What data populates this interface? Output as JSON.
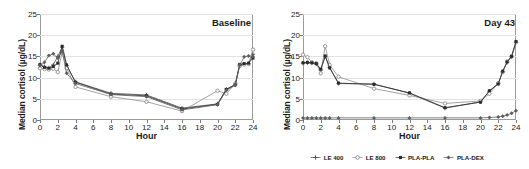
{
  "axes": {
    "ylabel": "Median cortisol (µg/dL)",
    "xlabel": "Hour",
    "yticks": [
      "0",
      "5",
      "10",
      "15",
      "20",
      "25"
    ],
    "xticks": [
      "0",
      "2",
      "4",
      "6",
      "8",
      "10",
      "12",
      "14",
      "16",
      "18",
      "20",
      "22",
      "24"
    ]
  },
  "legend": {
    "items": [
      {
        "label": "LE 400",
        "symbol": "plus-marker",
        "color": "#4d4d4d"
      },
      {
        "label": "LE 800",
        "symbol": "circle-marker",
        "color": "#8c8c8c"
      },
      {
        "label": "PLA-PLA",
        "symbol": "square-marker",
        "color": "#2b2b2b"
      },
      {
        "label": "PLA-DEX",
        "symbol": "diamond-marker",
        "color": "#5e5e5e"
      }
    ]
  },
  "chart_data": [
    {
      "type": "line",
      "title": "Baseline",
      "xlabel": "Hour",
      "ylabel": "Median cortisol (µg/dL)",
      "xlim": [
        0,
        24
      ],
      "ylim": [
        0,
        25
      ],
      "ytick_step": 5,
      "xtick_step": 2,
      "grid": true,
      "legend_position": "below-right-panel-shared",
      "series": [
        {
          "name": "LE 400",
          "color": "#4d4d4d",
          "x": [
            0,
            0.5,
            1,
            1.5,
            2,
            2.5,
            3,
            4,
            8,
            12,
            16,
            20,
            21,
            22,
            22.5,
            23,
            23.5,
            24
          ],
          "values": [
            13.0,
            12.6,
            12.3,
            13.0,
            15.0,
            17.2,
            12.8,
            9.0,
            6.3,
            5.9,
            2.8,
            3.8,
            7.3,
            8.4,
            13.0,
            13.2,
            13.3,
            15.5
          ]
        },
        {
          "name": "LE 800",
          "color": "#8c8c8c",
          "x": [
            0,
            0.5,
            1,
            1.5,
            2,
            2.5,
            3,
            4,
            8,
            12,
            16,
            20,
            21,
            22,
            22.5,
            23,
            23.5,
            24
          ],
          "values": [
            12.2,
            12.0,
            11.9,
            12.1,
            11.3,
            16.0,
            12.2,
            7.8,
            5.5,
            4.3,
            2.1,
            6.9,
            6.2,
            8.6,
            12.7,
            13.1,
            13.2,
            16.6
          ]
        },
        {
          "name": "PLA-PLA",
          "color": "#2b2b2b",
          "x": [
            0,
            0.5,
            1,
            1.5,
            2,
            2.5,
            3,
            4,
            8,
            12,
            16,
            20,
            21,
            22,
            22.5,
            23,
            23.5,
            24
          ],
          "values": [
            13.1,
            12.4,
            12.2,
            12.6,
            13.4,
            17.4,
            13.0,
            8.9,
            6.1,
            5.7,
            2.6,
            3.7,
            7.2,
            8.3,
            13.1,
            13.3,
            13.4,
            14.6
          ]
        },
        {
          "name": "PLA-DEX",
          "color": "#5e5e5e",
          "x": [
            0,
            0.5,
            1,
            1.5,
            2,
            2.5,
            3,
            4,
            8,
            12,
            16,
            20,
            21,
            22,
            22.5,
            23,
            23.5,
            24
          ],
          "values": [
            12.8,
            13.6,
            15.2,
            15.6,
            14.6,
            16.2,
            11.0,
            8.6,
            6.0,
            5.5,
            2.4,
            3.6,
            7.0,
            8.2,
            12.9,
            14.9,
            15.1,
            15.0
          ]
        }
      ]
    },
    {
      "type": "line",
      "title": "Day 43",
      "xlabel": "Hour",
      "ylabel": "Median cortisol (µg/dL)",
      "xlim": [
        0,
        24
      ],
      "ylim": [
        0,
        25
      ],
      "ytick_step": 5,
      "xtick_step": 2,
      "grid": true,
      "legend_position": "below",
      "series": [
        {
          "name": "LE 400",
          "color": "#4d4d4d",
          "x": [
            0,
            0.5,
            1,
            1.5,
            2,
            2.5,
            3,
            4,
            8,
            12,
            16,
            20,
            21,
            22,
            22.5,
            23,
            23.5,
            24
          ],
          "values": [
            13.4,
            13.5,
            13.4,
            13.2,
            11.8,
            15.0,
            12.4,
            8.6,
            8.5,
            6.3,
            2.8,
            4.3,
            6.8,
            8.6,
            11.4,
            13.6,
            14.9,
            18.4
          ]
        },
        {
          "name": "LE 800",
          "color": "#8c8c8c",
          "x": [
            0,
            0.5,
            1,
            1.5,
            2,
            2.5,
            3,
            4,
            8,
            12,
            16,
            20,
            21,
            22,
            22.5,
            23,
            23.5,
            24
          ],
          "values": [
            15.4,
            14.8,
            13.6,
            13.4,
            11.0,
            17.4,
            13.0,
            10.2,
            7.4,
            5.8,
            3.9,
            4.5,
            6.2,
            8.7,
            11.3,
            13.8,
            15.0,
            18.3
          ]
        },
        {
          "name": "PLA-PLA",
          "color": "#2b2b2b",
          "x": [
            0,
            0.5,
            1,
            1.5,
            2,
            2.5,
            3,
            4,
            8,
            12,
            16,
            20,
            21,
            22,
            22.5,
            23,
            23.5,
            24
          ],
          "values": [
            13.5,
            13.6,
            13.5,
            13.3,
            12.0,
            15.1,
            12.3,
            8.7,
            8.4,
            6.4,
            2.9,
            4.2,
            6.9,
            8.5,
            11.5,
            13.7,
            15.0,
            18.5
          ]
        },
        {
          "name": "PLA-DEX",
          "color": "#5e5e5e",
          "x": [
            0,
            0.5,
            1,
            1.5,
            2,
            2.5,
            3,
            4,
            8,
            12,
            16,
            20,
            21,
            22,
            22.5,
            23,
            23.5,
            24
          ],
          "values": [
            0.5,
            0.5,
            0.5,
            0.5,
            0.5,
            0.5,
            0.5,
            0.5,
            0.5,
            0.5,
            0.5,
            0.5,
            0.6,
            0.7,
            0.9,
            1.2,
            1.6,
            2.2
          ]
        }
      ]
    }
  ]
}
